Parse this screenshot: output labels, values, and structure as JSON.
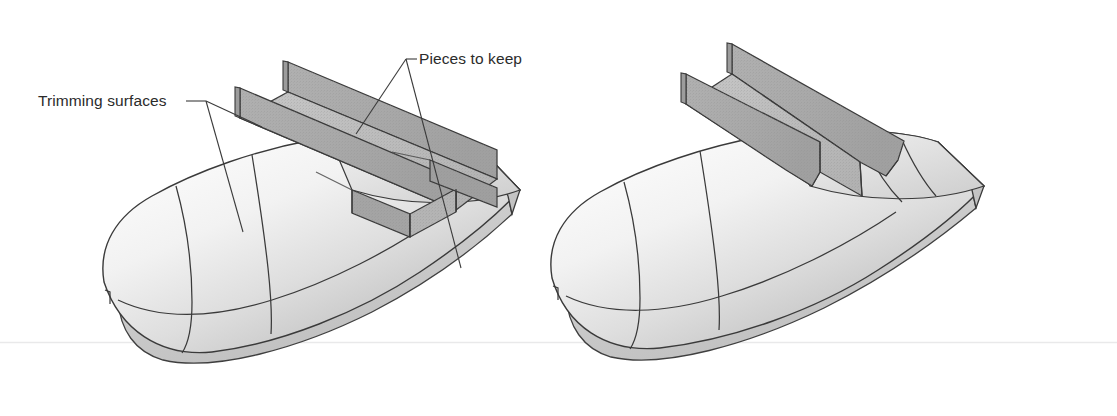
{
  "figure": {
    "title_visible": false,
    "background_color": "#ffffff",
    "scanline_color": "#e9e9ea",
    "description_kind": "cad-surface-trimming-illustration",
    "panels": [
      {
        "name": "before-trimming",
        "caption_visible": false,
        "annotations": [
          {
            "id": "trimming-surfaces",
            "text": "Trimming surfaces",
            "text_x": 38,
            "text_y": 106,
            "leader_vertex": [
              206,
              101
            ],
            "leader_targets": [
              [
                243,
                232
              ],
              [
                262,
                221
              ]
            ]
          },
          {
            "id": "pieces-to-keep",
            "text": "Pieces to keep",
            "text_x": 419,
            "text_y": 64,
            "leader_vertex": [
              406,
              59
            ],
            "leader_targets": [
              [
                355,
                133
              ],
              [
                461,
                268
              ]
            ]
          }
        ]
      },
      {
        "name": "after-trimming",
        "caption_visible": false,
        "annotations": []
      }
    ],
    "palette": {
      "outline": "#3a3a3a",
      "outline_soft": "#55555a",
      "leader_line": "#3b3b3b",
      "wall_fill": "#a8a8a8",
      "wall_fill_dark": "#9a9a9a",
      "web_fill": "#bdbdbd",
      "web_fill_dark": "#b0b0b0",
      "body_light": "#fbfbfb",
      "body_mid": "#e2e2e2",
      "body_shadow": "#c2c2c2",
      "tail_face": "#c9c9c9",
      "label_text": "#2b2b2b"
    },
    "geometry_note": "ogive nose, cylindrical midbody, flat-cut tail; U-channel of two vertical trimming planes plus horizontal web"
  }
}
